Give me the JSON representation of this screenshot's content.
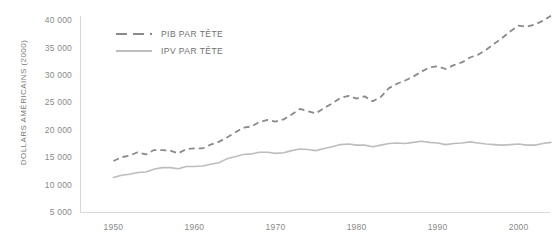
{
  "chart_data": {
    "type": "line",
    "title": "",
    "subtitle": "",
    "xlabel": "",
    "ylabel": "DOLLARS AMÉRICAINS (2000)",
    "xlim": [
      1946,
      2004
    ],
    "ylim": [
      5000,
      41500
    ],
    "grid": false,
    "legend_position": "top-left",
    "x_ticks": [
      "1950",
      "1960",
      "1970",
      "1980",
      "1990",
      "2000"
    ],
    "x_tick_values": [
      1950,
      1960,
      1970,
      1980,
      1990,
      2000
    ],
    "y_ticks": [
      "5 000",
      "10 000",
      "15 000",
      "20 000",
      "25 000",
      "30 000",
      "35 000",
      "40 000"
    ],
    "y_tick_values": [
      5000,
      10000,
      15000,
      20000,
      25000,
      30000,
      35000,
      40000
    ],
    "x": [
      1950,
      1951,
      1952,
      1953,
      1954,
      1955,
      1956,
      1957,
      1958,
      1959,
      1960,
      1961,
      1962,
      1963,
      1964,
      1965,
      1966,
      1967,
      1968,
      1969,
      1970,
      1971,
      1972,
      1973,
      1974,
      1975,
      1976,
      1977,
      1978,
      1979,
      1980,
      1981,
      1982,
      1983,
      1984,
      1985,
      1986,
      1987,
      1988,
      1989,
      1990,
      1991,
      1992,
      1993,
      1994,
      1995,
      1996,
      1997,
      1998,
      1999,
      2000,
      2001,
      2002,
      2003,
      2004
    ],
    "series": [
      {
        "name": "PIB PAR TÊTE",
        "style": "dashed",
        "color": "#8a8a8a",
        "values": [
          14300,
          15000,
          15300,
          15900,
          15500,
          16300,
          16300,
          16200,
          15700,
          16500,
          16600,
          16600,
          17300,
          17800,
          18600,
          19500,
          20400,
          20600,
          21400,
          21800,
          21500,
          21900,
          22800,
          23800,
          23400,
          23000,
          24000,
          24800,
          25800,
          26200,
          25700,
          26100,
          25200,
          26000,
          27600,
          28400,
          29000,
          29700,
          30600,
          31400,
          31600,
          31100,
          31800,
          32300,
          33200,
          33700,
          34600,
          35700,
          36800,
          38000,
          39000,
          38800,
          39200,
          39900,
          40800
        ]
      },
      {
        "name": "IPV PAR TÊTE",
        "style": "solid",
        "color": "#bdbdbd",
        "values": [
          11300,
          11700,
          11900,
          12200,
          12300,
          12800,
          13100,
          13100,
          12900,
          13300,
          13300,
          13400,
          13700,
          14000,
          14700,
          15100,
          15500,
          15600,
          15900,
          15900,
          15700,
          15800,
          16200,
          16500,
          16400,
          16200,
          16600,
          16900,
          17300,
          17400,
          17200,
          17200,
          16900,
          17200,
          17500,
          17600,
          17500,
          17700,
          17900,
          17700,
          17600,
          17300,
          17500,
          17600,
          17800,
          17600,
          17400,
          17300,
          17200,
          17300,
          17400,
          17200,
          17200,
          17500,
          17700
        ]
      }
    ]
  },
  "legend": {
    "items": [
      {
        "label": "PIB PAR TÊTE"
      },
      {
        "label": "IPV PAR TÊTE"
      }
    ]
  },
  "colors": {
    "background": "#ffffff",
    "axis": "#d8d8d8",
    "tick_text": "#8a8a8a",
    "axis_title": "#7a7a7a",
    "series_pib": "#8a8a8a",
    "series_ipv": "#bdbdbd"
  }
}
